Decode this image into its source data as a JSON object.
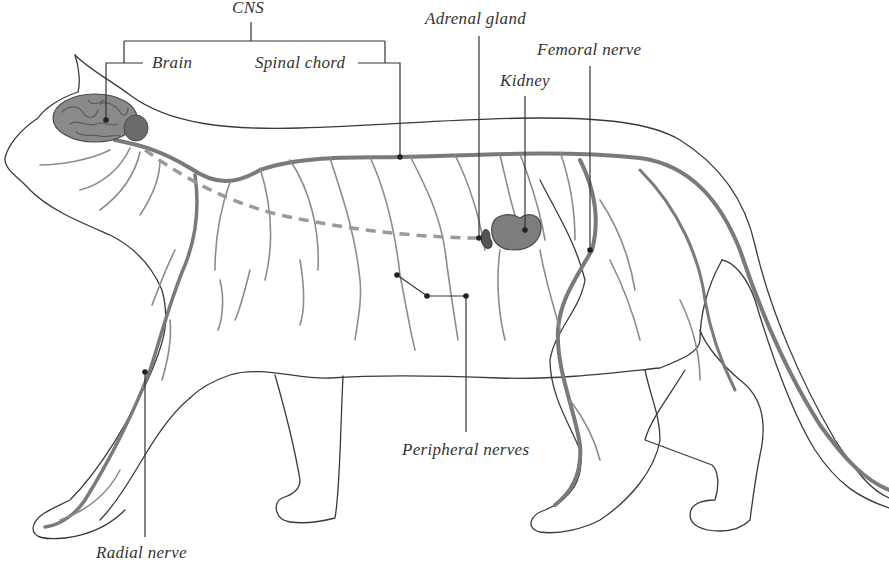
{
  "diagram": {
    "colors": {
      "outline": "#3a3a3a",
      "nerve": "#7a7a7a",
      "nerve_light": "#a8a8a8",
      "brain": "#8a8a8a",
      "kidney": "#7d7d7d",
      "leader": "#333333",
      "text": "#333333",
      "background": "#ffffff"
    },
    "labels": {
      "cns": "CNS",
      "brain": "Brain",
      "spinal_chord": "Spinal chord",
      "adrenal_gland": "Adrenal gland",
      "femoral_nerve": "Femoral nerve",
      "kidney": "Kidney",
      "peripheral_nerves": "Peripheral nerves",
      "radial_nerve": "Radial nerve"
    }
  }
}
